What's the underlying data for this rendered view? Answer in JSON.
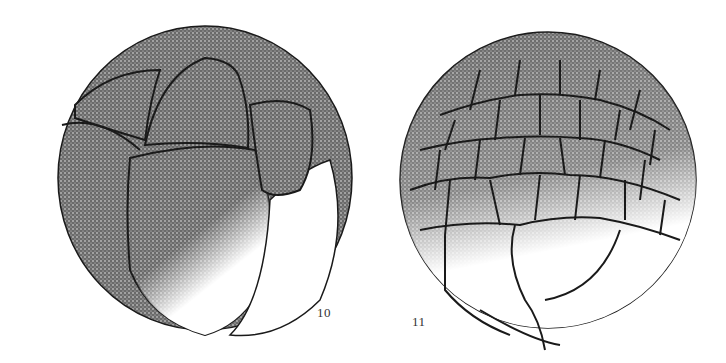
{
  "figure": {
    "panels": [
      {
        "id": "panel-10",
        "label": "10",
        "stage": "early cleavage (~16 blastomeres)"
      },
      {
        "id": "panel-11",
        "label": "11",
        "stage": "later cleavage / morula (many small animal-pole cells)"
      }
    ],
    "colors": {
      "ink": "#1a1a1a",
      "stipple_dark": "#3a3a3a",
      "background": "#ffffff"
    }
  }
}
